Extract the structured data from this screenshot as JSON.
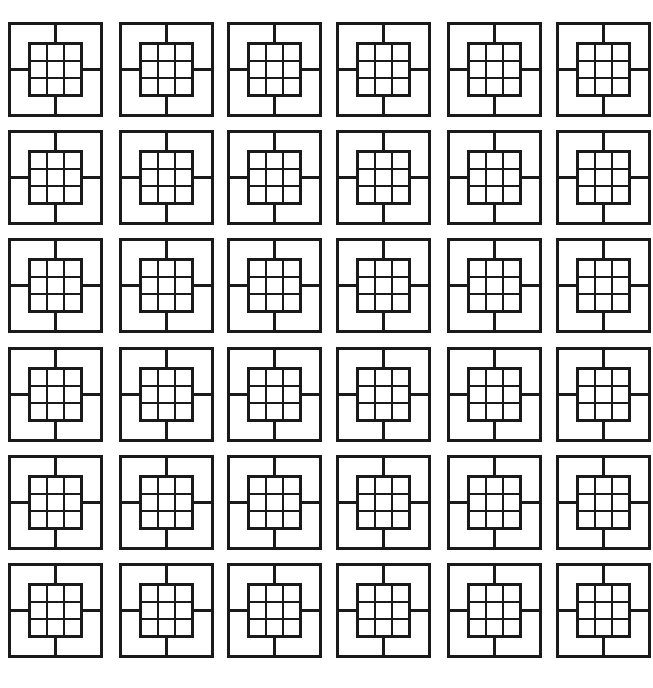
{
  "page": {
    "background_color": "#ffffff",
    "width": 653,
    "height": 688
  },
  "pattern": {
    "type": "grid-of-motifs",
    "stroke_color": "#1a1a1a",
    "fill_color": "none",
    "outer_stroke_width": 2.6,
    "cross_stroke_width": 2.6,
    "inner_stroke_width": 2.6,
    "inner_grid_stroke_width": 2.4,
    "rows": 6,
    "columns": 6,
    "total_motifs": 36,
    "tile_width": 95,
    "tile_height": 95,
    "column_x": [
      8,
      119,
      227,
      336,
      447,
      556
    ],
    "row_y": [
      22,
      130,
      238,
      347,
      455,
      563
    ],
    "block_gap_after_column": 3,
    "block_gap_after_row": 3,
    "motif": {
      "name": "crossed-square-with-nine-grid",
      "outer_square_inset": 0,
      "inner_square_inset_ratio": 0.225,
      "inner_grid_divisions": 3,
      "cross_divisions": 2,
      "quadrant_count": 4,
      "inner_cell_count": 9
    }
  },
  "chart_data": {
    "type": "heatmap",
    "xlabel": "",
    "ylabel": "",
    "categories": [
      "C1",
      "C2",
      "C3",
      "C4",
      "C5",
      "C6"
    ],
    "rows": [
      "R1",
      "R2",
      "R3",
      "R4",
      "R5",
      "R6"
    ],
    "values": [
      [
        1,
        1,
        1,
        1,
        1,
        1
      ],
      [
        1,
        1,
        1,
        1,
        1,
        1
      ],
      [
        1,
        1,
        1,
        1,
        1,
        1
      ],
      [
        1,
        1,
        1,
        1,
        1,
        1
      ],
      [
        1,
        1,
        1,
        1,
        1,
        1
      ],
      [
        1,
        1,
        1,
        1,
        1,
        1
      ]
    ],
    "grid": false,
    "legend": "none"
  }
}
